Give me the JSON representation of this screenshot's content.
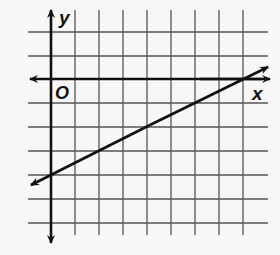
{
  "diagram": {
    "type": "coordinate-plane-line-graph",
    "axes": {
      "x_label": "x",
      "y_label": "y",
      "origin_label": "O"
    },
    "grid": {
      "unit_px": 24,
      "x_range": [
        -1,
        9
      ],
      "y_range": [
        -6,
        2
      ],
      "show_grid": true
    },
    "line": {
      "description": "line with slope 1/2 and y-intercept -4",
      "slope": 0.5,
      "y_intercept": -4,
      "x_intercept": 8,
      "points": [
        [
          0,
          -4
        ],
        [
          4,
          -2
        ],
        [
          8,
          0
        ]
      ],
      "arrows_both_ends": true
    },
    "colors": {
      "grid": "#555555",
      "axes": "#111111",
      "line": "#111111",
      "background": "#f7f7f7"
    }
  }
}
